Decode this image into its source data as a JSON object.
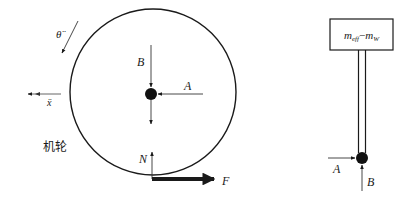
{
  "diagram": {
    "colors": {
      "stroke": "#1a1a1a",
      "force_line": "#333333",
      "background": "#ffffff"
    },
    "wheel": {
      "name_label": "机轮",
      "angular_accel_label": "θ̈",
      "linear_accel_label": "ẍ",
      "forces": {
        "top": "B",
        "right": "A",
        "normal": "N",
        "traction": "F"
      }
    },
    "strut": {
      "mass_label_main": "m",
      "mass_label_sub1": "eff",
      "mass_label_minus": "−",
      "mass_label_main2": "m",
      "mass_label_sub2": "W",
      "forces": {
        "left": "A",
        "bottom": "B"
      }
    }
  }
}
